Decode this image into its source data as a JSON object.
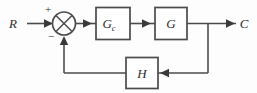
{
  "diagram": {
    "type": "control-system-block-diagram",
    "line_color": "#4b4b4b",
    "text_color": "#2e2e2e",
    "background_color": "#fdfdfd",
    "signals": {
      "input_label": "R",
      "output_label": "C"
    },
    "summing_junction": {
      "name": "summing-junction",
      "shape": "circle-with-cross",
      "plus_sign": "+",
      "minus_sign": "−",
      "plus_input": "R",
      "minus_input": "H feedback"
    },
    "blocks": [
      {
        "id": "gc",
        "label": "G",
        "subscript": "c",
        "name": "block-gc"
      },
      {
        "id": "g",
        "label": "G",
        "subscript": "",
        "name": "block-g"
      },
      {
        "id": "h",
        "label": "H",
        "subscript": "",
        "name": "block-h"
      }
    ],
    "connections": [
      "R to summing junction (+)",
      "summing junction to Gc",
      "Gc to G",
      "G to C output",
      "C branch down to H input",
      "H output to summing junction (−)"
    ]
  }
}
